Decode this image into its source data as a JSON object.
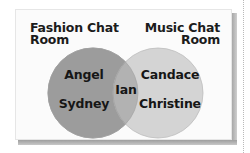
{
  "diagram": {
    "type": "venn",
    "sets": [
      {
        "title_line1": "Fashion Chat",
        "title_line2": "Room",
        "color": "#9a9a9a",
        "members": [
          "Angel",
          "Sydney"
        ]
      },
      {
        "title_line1": "Music Chat",
        "title_line2": "Room",
        "color": "#d3d3d3",
        "members": [
          "Candace",
          "Christine"
        ]
      }
    ],
    "intersection": {
      "members": [
        "Ian"
      ],
      "color": "#b3b3b3"
    },
    "frame_color": "#fbfbfb",
    "shadow_color": "#a8a8a8"
  }
}
